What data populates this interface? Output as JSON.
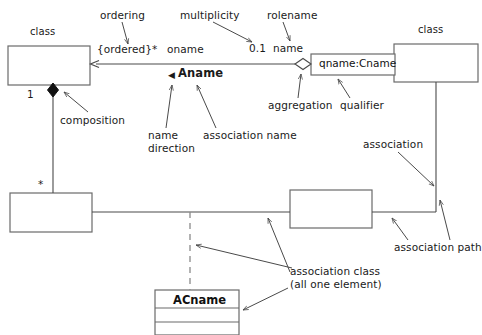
{
  "diagram": {
    "stroke_color": "#4a4a4a",
    "text_color": "#1a1a1a",
    "background": "#ffffff"
  },
  "boxes": {
    "top_left_class": {
      "label": "class",
      "name": ""
    },
    "top_right_class": {
      "label": "class",
      "name": ""
    },
    "qualifier_box": {
      "name": "qname:Cname"
    },
    "mid_left_box": {
      "name": ""
    },
    "mid_right_box": {
      "name": ""
    },
    "association_class": {
      "name": "ACname",
      "compartments": [
        "",
        ""
      ]
    }
  },
  "annotations": [
    {
      "key": "ordering",
      "text": "ordering"
    },
    {
      "key": "multiplicity",
      "text": "multiplicity"
    },
    {
      "key": "rolename",
      "text": "rolename"
    },
    {
      "key": "composition",
      "text": "composition"
    },
    {
      "key": "name_direction",
      "text": "name\ndirection"
    },
    {
      "key": "association_name",
      "text": "association name"
    },
    {
      "key": "aggregation",
      "text": "aggregation"
    },
    {
      "key": "qualifier",
      "text": "qualifier"
    },
    {
      "key": "association",
      "text": "association"
    },
    {
      "key": "association_path",
      "text": "association path"
    },
    {
      "key": "association_class",
      "text": "association class\n(all one element)"
    }
  ],
  "adornments": {
    "ordering_constraint": "{ordered}",
    "multiplicity_star_top": "*",
    "rolename_top": "oname",
    "multiplicity_right": "0.1",
    "rolename_right": "name",
    "association_name": "Aname",
    "name_direction_marker": "◀",
    "multiplicity_one": "1",
    "multiplicity_star_left": "*"
  },
  "labels": {
    "class_top_left": "class",
    "class_top_right": "class"
  }
}
